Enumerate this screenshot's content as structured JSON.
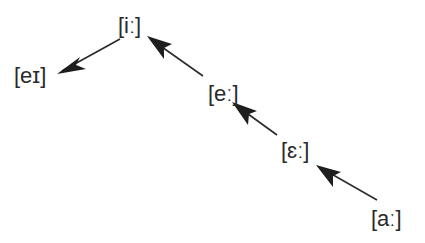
{
  "diagram": {
    "type": "vowel-shift-chain",
    "nodes": [
      {
        "id": "ii",
        "label": "[iː]",
        "x": 118,
        "y": 14
      },
      {
        "id": "ei",
        "label": "[eɪ]",
        "x": 14,
        "y": 64
      },
      {
        "id": "ee",
        "label": "[eː]",
        "x": 208,
        "y": 82
      },
      {
        "id": "eps",
        "label": "[ɛː]",
        "x": 281,
        "y": 139
      },
      {
        "id": "aa",
        "label": "[aː]",
        "x": 371,
        "y": 207
      }
    ],
    "edges": [
      {
        "from": "ii",
        "to": "ei"
      },
      {
        "from": "ee",
        "to": "ii"
      },
      {
        "from": "eps",
        "to": "ee"
      },
      {
        "from": "aa",
        "to": "eps"
      }
    ],
    "colors": {
      "line": "#2a2a2a",
      "text": "#2a2a2a",
      "background": "#ffffff"
    }
  }
}
